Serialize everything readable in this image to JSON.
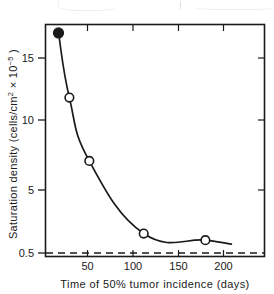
{
  "figure": {
    "name": "saturation-density-vs-tumor-incidence-plot",
    "ylabel_main": "Saturation density (cells/cm",
    "ylabel_sup1": "2",
    "ylabel_mid": " × 10",
    "ylabel_sup2": "−5",
    "ylabel_end": " )",
    "xlabel": "Time of 50% tumor incidence (days)"
  },
  "chart_data": {
    "type": "line",
    "title": "",
    "xlabel": "Time of 50% tumor incidence (days)",
    "ylabel": "Saturation density (cells/cm² × 10⁻⁵)",
    "xlim": [
      0,
      245
    ],
    "ylim": [
      0.5,
      18.5
    ],
    "grid": false,
    "legend": null,
    "x_ticks": [
      50,
      100,
      150,
      200
    ],
    "x_tick_labels": [
      "50",
      "100",
      "150",
      "200"
    ],
    "y_ticks": [
      0.5,
      5,
      10,
      15
    ],
    "y_tick_labels": [
      "0.5",
      "5",
      "10",
      "15"
    ],
    "series": [
      {
        "name": "Saturation density",
        "x": [
          18,
          30,
          52,
          112,
          180
        ],
        "y": [
          16.9,
          12.0,
          7.2,
          1.7,
          1.2
        ],
        "markers": [
          "filled",
          "open",
          "open",
          "open",
          "open"
        ]
      }
    ],
    "reference_line": {
      "name": "baseline",
      "y": 0.5,
      "style": "dashed"
    },
    "annotations": []
  },
  "axis_labels": {
    "y": [
      "15",
      "10",
      "5",
      "0.5"
    ],
    "x": [
      "50",
      "100",
      "150",
      "200"
    ]
  }
}
